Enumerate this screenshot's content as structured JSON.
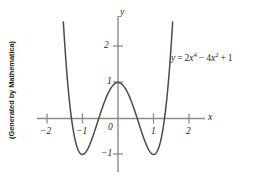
{
  "figure": {
    "credit": "(Generated by Mathematica)",
    "equation_text": "y = 2x4 − 4x2 + 1",
    "equation_parts": {
      "lhs": "y",
      "eq": "=",
      "term1_coef": "2",
      "term1_var": "x",
      "term1_exp": "4",
      "minus": "−",
      "term2_coef": "4",
      "term2_var": "x",
      "term2_exp": "2",
      "plus": "+",
      "constant": "1"
    },
    "x_axis_name": "x",
    "y_axis_name": "y"
  },
  "chart_data": {
    "type": "line",
    "title": "",
    "subtitle": "",
    "xlabel": "x",
    "ylabel": "y",
    "expression": "y = 2x^4 - 4x^2 + 1",
    "coefficients": [
      2,
      0,
      -4,
      0,
      1
    ],
    "xlim": [
      -2.15,
      2.15
    ],
    "ylim": [
      -1.45,
      2.7
    ],
    "grid": false,
    "legend": false,
    "legend_position": "none",
    "annotations": [
      {
        "text": "y = 2x4 − 4x2 + 1",
        "x": 1.05,
        "y": 1.95
      }
    ],
    "xticks": [
      -2,
      -1,
      0,
      1,
      2
    ],
    "xtick_labels": [
      "−2",
      "−1",
      "0",
      "1",
      "2"
    ],
    "yticks": [
      -1,
      1,
      2
    ],
    "ytick_labels": [
      "−1",
      "1",
      "2"
    ],
    "origin_label": "0",
    "features": {
      "local_maximum": {
        "x": 0,
        "y": 1
      },
      "local_minima": [
        {
          "x": -1,
          "y": -1
        },
        {
          "x": 1,
          "y": -1
        }
      ],
      "x_intercepts": [
        -1.307,
        -0.541,
        0.541,
        1.307
      ],
      "y_intercept": 1
    },
    "x": [
      -1.35,
      -1.3,
      -1.25,
      -1.2,
      -1.15,
      -1.1,
      -1.05,
      -1.0,
      -0.95,
      -0.9,
      -0.85,
      -0.8,
      -0.75,
      -0.7,
      -0.65,
      -0.6,
      -0.55,
      -0.5,
      -0.45,
      -0.4,
      -0.35,
      -0.3,
      -0.25,
      -0.2,
      -0.15,
      -0.1,
      -0.05,
      0,
      0.05,
      0.1,
      0.15,
      0.2,
      0.25,
      0.3,
      0.35,
      0.4,
      0.45,
      0.5,
      0.55,
      0.6,
      0.65,
      0.7,
      0.75,
      0.8,
      0.85,
      0.9,
      0.95,
      1.0,
      1.05,
      1.1,
      1.15,
      1.2,
      1.25,
      1.3,
      1.35
    ],
    "values": [
      1.35,
      0.95,
      0.63,
      0.38,
      0.21,
      0.09,
      0.02,
      0.0,
      0.02,
      0.07,
      0.15,
      0.26,
      0.38,
      0.52,
      0.67,
      0.82,
      0.96,
      1.09,
      1.2,
      1.31,
      1.41,
      1.49,
      1.56,
      1.62,
      1.67,
      1.72,
      1.76,
      1.78,
      1.79,
      1.79,
      1.77,
      1.75,
      1.72,
      1.67,
      1.6,
      1.53,
      1.44,
      1.33,
      1.21,
      1.08,
      0.94,
      0.79,
      0.63,
      0.47,
      0.3,
      0.14,
      0.0,
      0.0,
      0.02,
      0.09,
      0.21,
      0.38,
      0.63,
      0.95,
      1.35
    ],
    "colors": {
      "curve": "#4a4a4a",
      "axis": "#8c8c8c",
      "text": "#231f20",
      "background": "#ffffff"
    }
  }
}
